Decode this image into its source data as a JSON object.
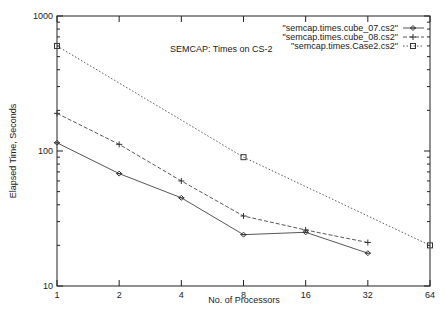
{
  "chart_data": {
    "type": "line",
    "title": "SEMCAP: Times on CS-2",
    "xlabel": "No. of Processors",
    "ylabel": "Elapsed Time, Seconds",
    "xscale": "log2",
    "yscale": "log10",
    "xlim": [
      1,
      64
    ],
    "ylim": [
      10,
      1000
    ],
    "x_ticks": [
      "1",
      "2",
      "4",
      "8",
      "16",
      "32",
      "64"
    ],
    "y_ticks": [
      "10",
      "100",
      "1000"
    ],
    "grid": false,
    "legend_position": "top-right",
    "series": [
      {
        "name": "\"semcap.times.cube_07.cs2\"",
        "marker": "diamond",
        "line": "solid",
        "x": [
          1,
          2,
          4,
          8,
          16,
          32
        ],
        "values": [
          115,
          68,
          45,
          24,
          25,
          17.5
        ]
      },
      {
        "name": "\"semcap.times.cube_08.cs2\"",
        "marker": "plus",
        "line": "dashed",
        "x": [
          1,
          2,
          4,
          8,
          16,
          32
        ],
        "values": [
          190,
          112,
          60,
          33,
          26,
          21
        ]
      },
      {
        "name": "\"semcap.times.Case2.cs2\"",
        "marker": "square",
        "line": "dotted",
        "x": [
          1,
          8,
          64
        ],
        "values": [
          600,
          90,
          20
        ]
      }
    ]
  }
}
